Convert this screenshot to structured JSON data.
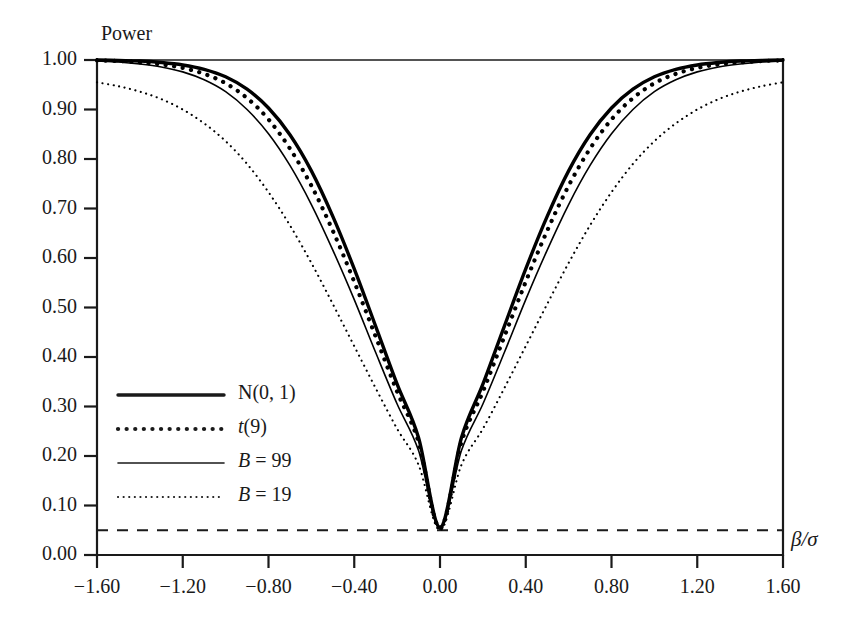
{
  "chart_data": {
    "type": "line",
    "title": "",
    "ylabel": "Power",
    "xlabel": "β/σ",
    "xlim": [
      -1.6,
      1.6
    ],
    "ylim": [
      0.0,
      1.0
    ],
    "grid": false,
    "legend_position": "inside-lower-left",
    "x_ticks": [
      "−1.60",
      "−1.20",
      "−0.80",
      "−0.40",
      "0.00",
      "0.40",
      "0.80",
      "1.20",
      "1.60"
    ],
    "x_tick_values": [
      -1.6,
      -1.2,
      -0.8,
      -0.4,
      0.0,
      0.4,
      0.8,
      1.2,
      1.6
    ],
    "y_ticks": [
      "0.00",
      "0.10",
      "0.20",
      "0.30",
      "0.40",
      "0.50",
      "0.60",
      "0.70",
      "0.80",
      "0.90",
      "1.00"
    ],
    "y_tick_values": [
      0.0,
      0.1,
      0.2,
      0.3,
      0.4,
      0.5,
      0.6,
      0.7,
      0.8,
      0.9,
      1.0
    ],
    "annotations": [
      {
        "name": "nominal-level-line",
        "type": "hline",
        "value": 0.05,
        "style": "dashed",
        "label": ""
      }
    ],
    "x": [
      -1.6,
      -1.5,
      -1.4,
      -1.3,
      -1.2,
      -1.1,
      -1.0,
      -0.9,
      -0.8,
      -0.7,
      -0.6,
      -0.5,
      -0.4,
      -0.3,
      -0.2,
      -0.1,
      0.0,
      0.1,
      0.2,
      0.3,
      0.4,
      0.5,
      0.6,
      0.7,
      0.8,
      0.9,
      1.0,
      1.1,
      1.2,
      1.3,
      1.4,
      1.5,
      1.6
    ],
    "series": [
      {
        "name": "N(0, 1)",
        "style": "solid",
        "width": "thick",
        "color": "#000000",
        "values": [
          1.0,
          0.999,
          0.998,
          0.995,
          0.99,
          0.981,
          0.966,
          0.941,
          0.903,
          0.849,
          0.776,
          0.684,
          0.578,
          0.462,
          0.345,
          0.237,
          0.056,
          0.237,
          0.345,
          0.462,
          0.578,
          0.684,
          0.776,
          0.849,
          0.903,
          0.941,
          0.966,
          0.981,
          0.99,
          0.995,
          0.998,
          0.999,
          1.0
        ]
      },
      {
        "name": "t(9)",
        "style": "dotted",
        "width": "thick",
        "color": "#000000",
        "values": [
          0.999,
          0.998,
          0.995,
          0.991,
          0.984,
          0.972,
          0.953,
          0.923,
          0.88,
          0.821,
          0.746,
          0.655,
          0.552,
          0.441,
          0.33,
          0.228,
          0.054,
          0.228,
          0.33,
          0.441,
          0.552,
          0.655,
          0.746,
          0.821,
          0.88,
          0.923,
          0.953,
          0.972,
          0.984,
          0.991,
          0.995,
          0.998,
          0.999
        ]
      },
      {
        "name": "B = 99",
        "style": "solid",
        "width": "thin",
        "color": "#000000",
        "values": [
          0.998,
          0.996,
          0.992,
          0.986,
          0.976,
          0.96,
          0.936,
          0.9,
          0.851,
          0.787,
          0.708,
          0.616,
          0.516,
          0.409,
          0.305,
          0.211,
          0.052,
          0.211,
          0.305,
          0.409,
          0.516,
          0.616,
          0.708,
          0.787,
          0.851,
          0.9,
          0.936,
          0.96,
          0.976,
          0.986,
          0.992,
          0.996,
          0.998
        ]
      },
      {
        "name": "B = 19",
        "style": "dotted",
        "width": "thin",
        "color": "#000000",
        "values": [
          0.955,
          0.947,
          0.936,
          0.921,
          0.9,
          0.872,
          0.836,
          0.79,
          0.733,
          0.666,
          0.59,
          0.507,
          0.422,
          0.337,
          0.255,
          0.182,
          0.05,
          0.182,
          0.255,
          0.337,
          0.422,
          0.507,
          0.59,
          0.666,
          0.733,
          0.79,
          0.836,
          0.872,
          0.9,
          0.921,
          0.936,
          0.947,
          0.955
        ]
      }
    ]
  },
  "axes": {
    "y_title": "Power",
    "x_title": "β/σ"
  },
  "legend": {
    "items": [
      {
        "label": "N(0, 1)",
        "style": "solid-thick"
      },
      {
        "label": "t(9)",
        "style": "dotted-thick"
      },
      {
        "label": "B = 99",
        "style": "solid-thin"
      },
      {
        "label": "B = 19",
        "style": "dotted-thin"
      }
    ]
  }
}
